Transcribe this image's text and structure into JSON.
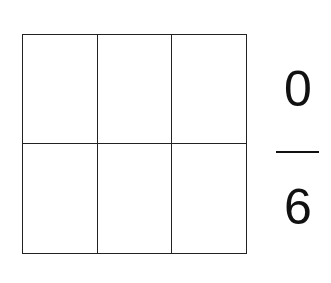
{
  "diagram": {
    "type": "fraction-area-model",
    "grid": {
      "rows": 2,
      "cols": 3,
      "shaded_cells": 0,
      "line_color": "#222222"
    },
    "fraction": {
      "numerator": "0",
      "denominator": "6"
    }
  }
}
